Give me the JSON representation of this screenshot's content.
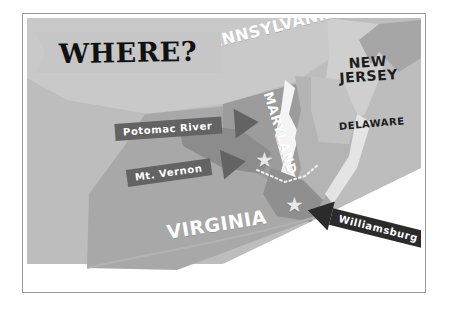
{
  "figure": {
    "kind": "illustrated-locator-map",
    "title_banner": {
      "text": "WHERE?"
    }
  },
  "palette": {
    "page_background": "#ffffff",
    "frame_border": "#9a9a9a",
    "water_light": "#bdbdbd",
    "land_mid": "#a8a8a8",
    "land_dark": "#8a8a8a",
    "land_darkest": "#6f6f6f",
    "bay_white": "#f2f2f2",
    "banner_fill": "#c6c6c6",
    "banner_text": "#111111",
    "callout_gray": "#636363",
    "callout_black": "#2b2b2b",
    "callout_text": "#ffffff",
    "state_label_white": "#ffffff",
    "state_label_dark": "#1d1d1d",
    "star_fill": "#e8e8e8"
  },
  "state_labels": [
    {
      "name": "pennsylvania",
      "text": "PENNSYLVANIA",
      "style": "white",
      "rotation_deg": -14
    },
    {
      "name": "maryland",
      "text": "MARYLAND",
      "style": "white",
      "rotation_deg": 73
    },
    {
      "name": "virginia",
      "text": "VIRGINIA",
      "style": "white",
      "rotation_deg": -9
    },
    {
      "name": "new-jersey",
      "text": "NEW\nJERSEY",
      "style": "dark",
      "rotation_deg": -4
    },
    {
      "name": "delaware",
      "text": "DELAWARE",
      "style": "dark",
      "rotation_deg": -5
    }
  ],
  "state_label_text": {
    "pennsylvania": "PENNSYLVANIA",
    "maryland": "MARYLAND",
    "virginia": "VIRGINIA",
    "new_jersey_line1": "NEW",
    "new_jersey_line2": "JERSEY",
    "delaware": "DELAWARE"
  },
  "callouts": [
    {
      "name": "potomac-river",
      "text": "Potomac River",
      "arrow_direction": "right",
      "color": "#636363"
    },
    {
      "name": "mt-vernon",
      "text": "Mt. Vernon",
      "arrow_direction": "right",
      "color": "#636363"
    },
    {
      "name": "williamsburg",
      "text": "Williamsburg",
      "arrow_direction": "left",
      "color": "#2b2b2b"
    }
  ],
  "callout_text": {
    "potomac": "Potomac River",
    "mt_vernon": "Mt. Vernon",
    "williamsburg": "Williamsburg"
  },
  "markers": [
    {
      "name": "star-mount-vernon",
      "glyph": "star",
      "x": 236,
      "y": 142
    },
    {
      "name": "star-williamsburg",
      "glyph": "star",
      "x": 266,
      "y": 187
    }
  ],
  "marker_glyph": "★"
}
